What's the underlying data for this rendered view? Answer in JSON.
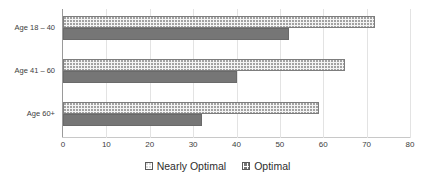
{
  "chart_data": {
    "type": "bar",
    "orientation": "horizontal",
    "title": "",
    "xlabel": "",
    "ylabel": "",
    "categories": [
      "Age 18 – 40",
      "Age 41 – 60",
      "Age 60+"
    ],
    "series": [
      {
        "name": "Nearly Optimal",
        "values": [
          72,
          65,
          59
        ],
        "color": "#f4f4f4",
        "pattern": "dotted"
      },
      {
        "name": "Optimal",
        "values": [
          52,
          40,
          32
        ],
        "color": "#767676",
        "pattern": "solid"
      }
    ],
    "xlim": [
      0,
      80
    ],
    "xticks": [
      0,
      10,
      20,
      30,
      40,
      50,
      60,
      70,
      80
    ],
    "xtick_labels": [
      "0",
      "10",
      "20",
      "30",
      "40",
      "50",
      "60",
      "70",
      "80"
    ],
    "grid": true,
    "grid_axis": "x",
    "legend_position": "bottom"
  },
  "legend": {
    "items": [
      {
        "label": "Nearly Optimal",
        "swatch": "nearly-optimal-swatch"
      },
      {
        "label": "Optimal",
        "swatch": "optimal-swatch"
      }
    ]
  },
  "colors": {
    "nearly_optimal": "#f4f4f4",
    "optimal": "#767676",
    "gridline": "#e3e3e3",
    "axis": "#9a9a9a",
    "text": "#3d3d3d",
    "background": "#ffffff"
  }
}
